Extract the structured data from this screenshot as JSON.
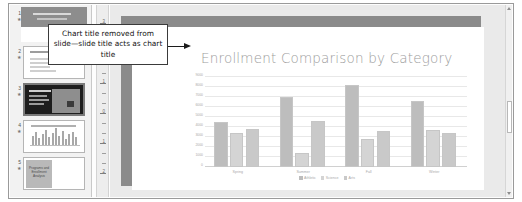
{
  "callout": {
    "text": "Chart title removed from slide—slide title acts as chart title",
    "arrow_icon": "right-arrow-icon"
  },
  "slide": {
    "title": "Enrollment Comparison by Category"
  },
  "thumbnails": {
    "star_glyph": "★",
    "items": [
      {
        "number": "1",
        "name": "title-slide",
        "selected": false
      },
      {
        "number": "2",
        "name": "text-slide",
        "selected": false
      },
      {
        "number": "3",
        "name": "picture-slide",
        "selected": true
      },
      {
        "number": "4",
        "name": "chart-slide",
        "selected": false
      },
      {
        "number": "5",
        "name": "two-content-slide",
        "selected": false
      }
    ],
    "slide5_text": "Programs and Enrollment Analysis"
  },
  "ruler": {
    "labels": [
      "3",
      "2",
      "1",
      "0",
      "1",
      "2",
      "3"
    ]
  },
  "scrollbar": {
    "up_icon": "scroll-up-arrow-icon",
    "down_icon": "scroll-down-arrow-icon"
  },
  "chart_data": {
    "type": "bar",
    "title": "Enrollment Comparison by Category",
    "xlabel": "",
    "ylabel": "",
    "categories": [
      "Spring",
      "Summer",
      "Fall",
      "Winter"
    ],
    "series": [
      {
        "name": "Athletic",
        "color": "#bdbdbd",
        "values": [
          4500,
          7000,
          8200,
          6600
        ]
      },
      {
        "name": "Science",
        "color": "#d4d4d4",
        "values": [
          3400,
          1400,
          2800,
          3700
        ]
      },
      {
        "name": "Arts",
        "color": "#c9c9c9",
        "values": [
          3800,
          4600,
          3600,
          3400
        ]
      }
    ],
    "ylim": [
      0,
      9000
    ],
    "yticks": [
      0,
      1000,
      2000,
      3000,
      4000,
      5000,
      6000,
      7000,
      8000,
      9000
    ],
    "ytick_labels": [
      "0",
      "1000",
      "2000",
      "3000",
      "4000",
      "5000",
      "6000",
      "7000",
      "8000",
      "9000"
    ],
    "grid": true,
    "legend_position": "bottom"
  }
}
